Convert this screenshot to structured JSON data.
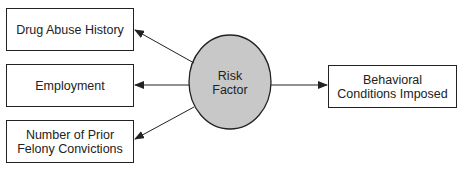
{
  "diagram": {
    "type": "flow",
    "center_node": {
      "label_line1": "Risk",
      "label_line2": "Factor",
      "fill": "#c8c8c8"
    },
    "left_nodes": [
      {
        "label": "Drug Abuse History"
      },
      {
        "label": "Employment"
      },
      {
        "label_line1": "Number of Prior",
        "label_line2": "Felony Convictions"
      }
    ],
    "right_node": {
      "label_line1": "Behavioral",
      "label_line2": "Conditions Imposed"
    },
    "edges": [
      {
        "from": "Risk Factor",
        "to": "Drug Abuse History"
      },
      {
        "from": "Risk Factor",
        "to": "Employment"
      },
      {
        "from": "Risk Factor",
        "to": "Number of Prior Felony Convictions"
      },
      {
        "from": "Risk Factor",
        "to": "Behavioral Conditions Imposed"
      }
    ]
  }
}
